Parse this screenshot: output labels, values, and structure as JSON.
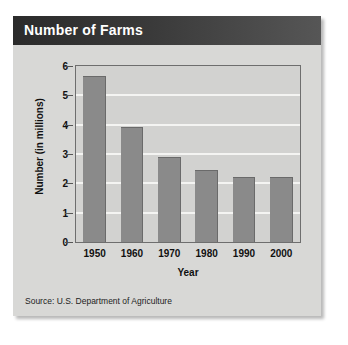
{
  "card": {
    "title": "Number of Farms",
    "source": "Source: U.S. Department of Agriculture"
  },
  "colors": {
    "header_bar": "#2b2b2b",
    "card_background": "#d8d8d6",
    "plot_background": "#d2d2d0",
    "bar_fill": "#8a8a8a",
    "gridline": "#f4f4f2",
    "axis_line": "#6e6e6e",
    "title_text": "#ffffff",
    "body_text": "#101010"
  },
  "chart_data": {
    "type": "bar",
    "title": "Number of Farms",
    "categories": [
      "1950",
      "1960",
      "1970",
      "1980",
      "1990",
      "2000"
    ],
    "values": [
      5.65,
      3.93,
      2.9,
      2.45,
      2.2,
      2.2
    ],
    "xlabel": "Year",
    "ylabel": "Number (in millions)",
    "ylim": [
      0,
      6
    ],
    "yticks": [
      "0",
      "1",
      "2",
      "3",
      "4",
      "5",
      "6"
    ],
    "ytick_values": [
      0,
      1,
      2,
      3,
      4,
      5,
      6
    ],
    "grid": "horizontal",
    "legend": "none",
    "source": "Source: U.S. Department of Agriculture"
  }
}
